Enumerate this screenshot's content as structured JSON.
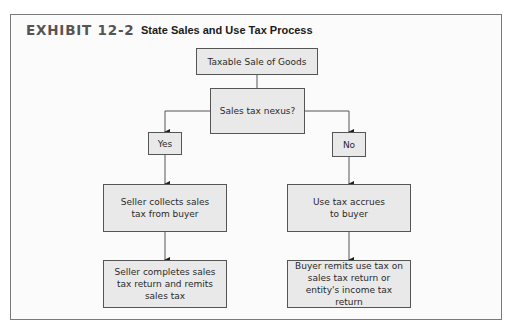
{
  "exhibit": {
    "label": "EXHIBIT 12-2",
    "title": "State Sales and Use Tax Process"
  },
  "colors": {
    "box_fill": "#e9e9e9",
    "box_border": "#555555",
    "label_gray": "#555555",
    "frame_border": "#7a7a7a"
  },
  "flowchart": {
    "nodes": {
      "start": "Taxable Sale of Goods",
      "decision": "Sales tax nexus?",
      "yes": "Yes",
      "no": "No",
      "seller_collects": "Seller collects sales tax from buyer",
      "use_tax_accrues": "Use tax accrues to buyer",
      "seller_remits": "Seller completes sales tax return and remits sales tax",
      "buyer_remits": "Buyer remits use tax on sales tax return or entity's income tax return"
    },
    "edges": [
      {
        "from": "start",
        "to": "decision"
      },
      {
        "from": "decision",
        "to": "yes"
      },
      {
        "from": "decision",
        "to": "no"
      },
      {
        "from": "yes",
        "to": "seller_collects"
      },
      {
        "from": "no",
        "to": "use_tax_accrues"
      },
      {
        "from": "seller_collects",
        "to": "seller_remits"
      },
      {
        "from": "use_tax_accrues",
        "to": "buyer_remits"
      }
    ]
  }
}
